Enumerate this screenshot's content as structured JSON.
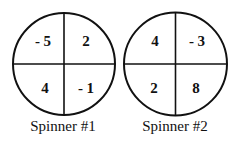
{
  "spinners": [
    {
      "caption": "Spinner #1",
      "sections": {
        "top_left": "- 5",
        "top_right": "2",
        "bottom_left": "4",
        "bottom_right": "- 1"
      }
    },
    {
      "caption": "Spinner #2",
      "sections": {
        "top_left": "4",
        "top_right": "- 3",
        "bottom_left": "2",
        "bottom_right": "8"
      }
    }
  ]
}
